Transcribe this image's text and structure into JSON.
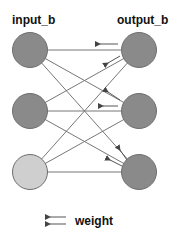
{
  "labels": {
    "input": "input_b",
    "output": "output_b",
    "legend": "weight"
  },
  "colors": {
    "node_dark": "#8a8a8a",
    "node_light": "#cfcfcf",
    "edge": "#777777",
    "arrow": "#555555"
  },
  "nodes": {
    "input": [
      {
        "cx": 30,
        "cy": 50,
        "fill": "#8a8a8a"
      },
      {
        "cx": 30,
        "cy": 111,
        "fill": "#8a8a8a"
      },
      {
        "cx": 30,
        "cy": 172,
        "fill": "#cfcfcf"
      }
    ],
    "output": [
      {
        "cx": 139,
        "cy": 50,
        "fill": "#8a8a8a"
      },
      {
        "cx": 139,
        "cy": 111,
        "fill": "#8a8a8a"
      },
      {
        "cx": 139,
        "cy": 172,
        "fill": "#8a8a8a"
      }
    ],
    "radius": 17.5
  }
}
